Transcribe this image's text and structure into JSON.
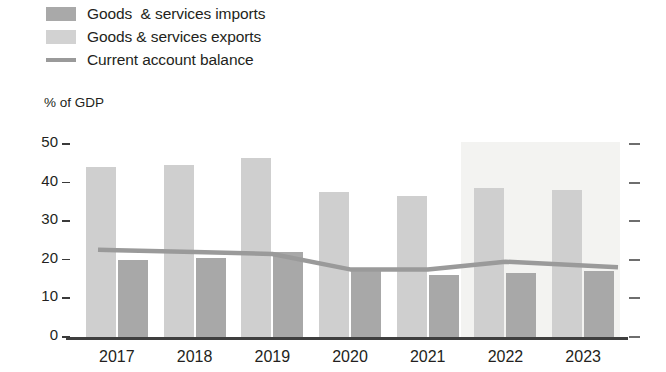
{
  "legend": {
    "items": [
      {
        "label": "Goods  & services imports",
        "swatch": "imports-swatch",
        "color": "#a9a9a9",
        "type": "bar"
      },
      {
        "label": "Goods & services exports",
        "swatch": "exports-swatch",
        "color": "#d2d2d2",
        "type": "bar"
      },
      {
        "label": "Current account balance",
        "swatch": "line-swatch",
        "color": "#9a9a9a",
        "type": "line"
      }
    ]
  },
  "axis": {
    "unit_caption": "% of GDP",
    "y_ticks": [
      "50",
      "40",
      "30",
      "20",
      "10",
      "0"
    ],
    "x_ticks": [
      "2017",
      "2018",
      "2019",
      "2020",
      "2021",
      "2022",
      "2023"
    ]
  },
  "colors": {
    "exports_bar": "#cfcfcf",
    "imports_bar": "#a8a8a8",
    "balance_line": "#9a9a9a",
    "forecast_band": "#f3f3f1",
    "axis_line": "#3f3f3f",
    "text": "#231f20"
  },
  "chart_data": {
    "type": "bar",
    "title": "",
    "subtitle": "",
    "xlabel": "",
    "ylabel": "% of GDP",
    "ylim": [
      0,
      50
    ],
    "ytick_values": [
      0,
      10,
      20,
      30,
      40,
      50
    ],
    "grid": false,
    "legend_position": "top-left",
    "categories": [
      "2017",
      "2018",
      "2019",
      "2020",
      "2021",
      "2022",
      "2023"
    ],
    "series": [
      {
        "name": "Goods & services exports",
        "type": "bar",
        "color": "#cfcfcf",
        "values": [
          44.0,
          44.5,
          46.5,
          37.5,
          36.5,
          38.5,
          38.0
        ]
      },
      {
        "name": "Goods  & services imports",
        "type": "bar",
        "color": "#a8a8a8",
        "values": [
          20.0,
          20.5,
          22.0,
          18.0,
          16.0,
          16.5,
          17.0
        ]
      },
      {
        "name": "Current account balance",
        "type": "line",
        "color": "#9a9a9a",
        "values": [
          22.5,
          22.0,
          21.5,
          17.5,
          17.5,
          19.5,
          18.5
        ]
      }
    ],
    "annotations": [
      {
        "name": "forecast-band",
        "label": "",
        "from": "2022",
        "to": "2023",
        "color": "#f3f3f1"
      }
    ]
  }
}
